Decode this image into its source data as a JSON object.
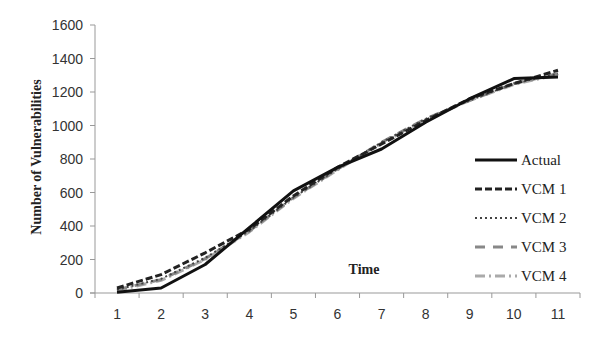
{
  "chart_data": {
    "type": "line",
    "title": "",
    "xlabel": "Time",
    "ylabel": "Number of Vulnerabilities",
    "categories": [
      "1",
      "2",
      "3",
      "4",
      "5",
      "6",
      "7",
      "8",
      "9",
      "10",
      "11"
    ],
    "yticks": [
      "0",
      "200",
      "400",
      "600",
      "800",
      "1000",
      "1200",
      "1400",
      "1600"
    ],
    "ylim": [
      0,
      1600
    ],
    "grid": false,
    "legend_position": "right-inside",
    "series": [
      {
        "name": "Actual",
        "color": "#111111",
        "dash": "",
        "width": 3,
        "values": [
          5,
          30,
          170,
          390,
          610,
          750,
          860,
          1020,
          1160,
          1280,
          1290
        ]
      },
      {
        "name": "VCM 1",
        "color": "#222222",
        "dash": "7,3",
        "width": 3,
        "values": [
          30,
          110,
          240,
          380,
          580,
          750,
          890,
          1030,
          1160,
          1250,
          1330
        ]
      },
      {
        "name": "VCM 2",
        "color": "#444444",
        "dash": "2,3",
        "width": 2,
        "values": [
          20,
          85,
          210,
          370,
          570,
          740,
          900,
          1040,
          1150,
          1250,
          1310
        ]
      },
      {
        "name": "VCM 3",
        "color": "#888888",
        "dash": "10,8",
        "width": 3,
        "values": [
          20,
          80,
          205,
          370,
          570,
          740,
          900,
          1040,
          1150,
          1250,
          1310
        ]
      },
      {
        "name": "VCM 4",
        "color": "#aaaaaa",
        "dash": "10,4,2,4",
        "width": 3,
        "values": [
          15,
          75,
          200,
          365,
          565,
          735,
          895,
          1035,
          1150,
          1245,
          1305
        ]
      }
    ]
  }
}
